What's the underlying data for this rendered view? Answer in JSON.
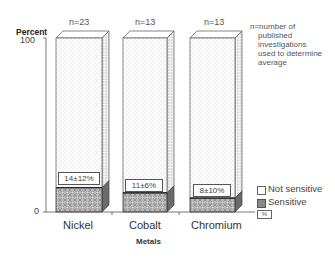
{
  "chart_data": {
    "type": "bar",
    "stacked": true,
    "title": "",
    "xlabel": "Metals",
    "ylabel": "Percent",
    "ylim": [
      0,
      100
    ],
    "yticks": [
      "0",
      "100"
    ],
    "categories": [
      "Nickel",
      "Cobalt",
      "Chromium"
    ],
    "series": [
      {
        "name": "Sensitive",
        "values": [
          14,
          11,
          8
        ]
      },
      {
        "name": "Not sensitive",
        "values": [
          86,
          89,
          92
        ]
      }
    ],
    "value_labels": [
      "14±12%",
      "11±6%",
      "8±10%"
    ],
    "n_labels": [
      "n=23",
      "n=13",
      "n=13"
    ],
    "annotation": "n=number of published investigations used to determine average",
    "legend": {
      "position": "right",
      "entries": [
        "Not sensitive",
        "Sensitive",
        "%"
      ]
    },
    "grid": false
  },
  "axis": {
    "y_top": "100",
    "y_bottom": "0",
    "ylabel": "Percent",
    "xlabel": "Metals"
  },
  "note": {
    "line1": "n=number of",
    "line2": "published",
    "line3": "investigations",
    "line4": "used to determine",
    "line5": "average"
  },
  "legend": {
    "not_sensitive": "Not sensitive",
    "sensitive": "Sensitive",
    "pct": "%"
  }
}
